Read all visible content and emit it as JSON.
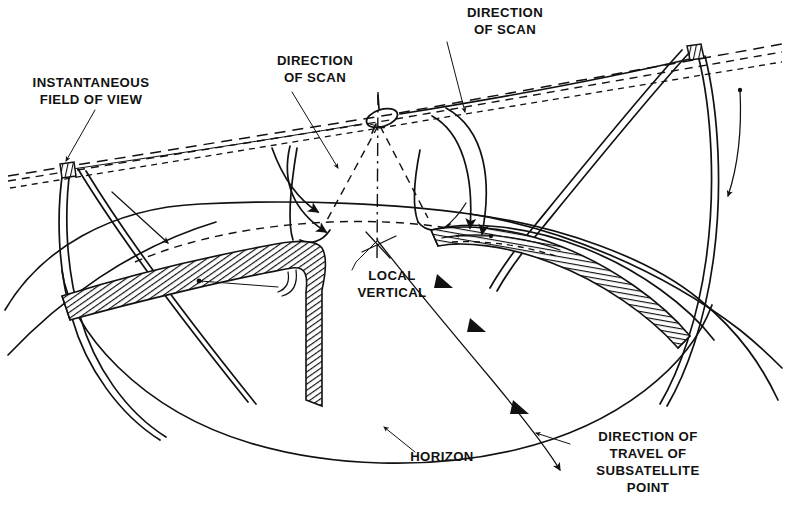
{
  "figure": {
    "background_color": "#ffffff",
    "ink_color": "#111111",
    "width": 785,
    "height": 506
  },
  "labels": {
    "instantaneous_field_of_view": "INSTANTANEOUS\nFIELD OF VIEW",
    "instantaneous_field_of_view_line1": "INSTANTANEOUS",
    "instantaneous_field_of_view_line2": "FIELD OF VIEW",
    "direction_of_scan_left_line1": "DIRECTION",
    "direction_of_scan_left_line2": "OF SCAN",
    "direction_of_scan_right_line1": "DIRECTION",
    "direction_of_scan_right_line2": "OF SCAN",
    "local_vertical_line1": "LOCAL",
    "local_vertical_line2": "VERTICAL",
    "horizon": "HORIZON",
    "direction_of_travel_line1": "DIRECTION OF",
    "direction_of_travel_line2": "TRAVEL OF",
    "direction_of_travel_line3": "SUBSATELLITE",
    "direction_of_travel_line4": "POINT"
  },
  "elements": {
    "satellite": "satellite-body",
    "earth_limb": "earth-horizon-arc",
    "scan_swath_left": "left-scan-swath-band",
    "scan_swath_right": "right-scan-swath-band",
    "ifov_marker_left": "left-instantaneous-field-of-view",
    "ifov_marker_right": "right-instantaneous-field-of-view",
    "local_vertical_axis": "local-vertical-dash-dot-line",
    "subsatellite_track": "subsatellite-ground-track"
  }
}
